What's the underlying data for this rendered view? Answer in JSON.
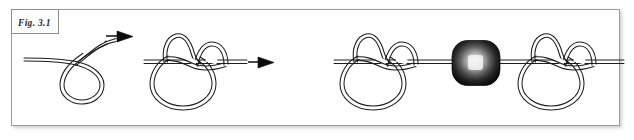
{
  "figure": {
    "label": "Fig. 3.1",
    "caption_style": "italic-serif",
    "frame_border_color": "#9b9b9b",
    "background_color": "#ffffff",
    "rope_color": "#1d1d1f",
    "arrow_color": "#0b0b0b",
    "bead_dark_color": "#111111",
    "bead_highlight_color": "#f2f2f2"
  },
  "panels": [
    {
      "id": "panel-1",
      "name": "open-loop",
      "description": "Rope entering from left, curling into a single open loop with free end rising to the right",
      "has_bead": false
    },
    {
      "id": "panel-2",
      "name": "tied-knot",
      "description": "Rope tied into a closed overhand-style knot with two upper lobes and a lower round bight",
      "has_bead": false
    },
    {
      "id": "panel-3",
      "name": "knot-bead-knot",
      "description": "Two tied knots joined along a single rope with a dark bead threaded between them",
      "has_bead": true
    }
  ],
  "arrows": [
    {
      "id": "arrow-1",
      "label": "",
      "from_panel": "panel-1",
      "to_panel": "panel-2"
    },
    {
      "id": "arrow-2",
      "label": "",
      "from_panel": "panel-2",
      "to_panel": "panel-3"
    }
  ],
  "bead": {
    "id": "bead-1",
    "shape": "rounded-rectangle",
    "shading": "radial-highlight-center"
  }
}
